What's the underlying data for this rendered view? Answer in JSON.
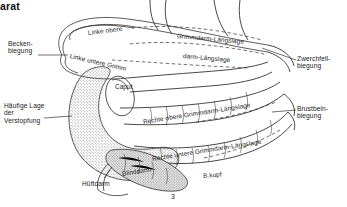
{
  "figure": {
    "title_fragment": "arat",
    "page_number": "3",
    "width": 347,
    "height": 207,
    "background": "#ffffff",
    "ink_color": "#1a1a1a",
    "shading_color": "#a8a8a8"
  },
  "callouts": {
    "left": [
      {
        "id": "becken-biegung",
        "text": "Becken-\nbiegung",
        "x": 8,
        "y": 40
      },
      {
        "id": "haeufige-lage",
        "text": "Häufige Lage\nder\nVerstopfung",
        "x": 4,
        "y": 102
      }
    ],
    "right": [
      {
        "id": "zwerchfell-biegung",
        "text": "Zwerchfell-\nbiegung",
        "x": 297,
        "y": 55
      },
      {
        "id": "brustbein-biegung",
        "text": "Brustbein-\nbiegung",
        "x": 297,
        "y": 105
      }
    ],
    "bottom": [
      {
        "id": "hueftdarm",
        "text": "Hüftdarm",
        "x": 82,
        "y": 180
      }
    ]
  },
  "curve_labels": [
    {
      "id": "linke-obere",
      "text": "Linke obere",
      "x": 88,
      "y": 29,
      "rotate": -7
    },
    {
      "id": "linke-untere-grimm",
      "text": "Linke untere Grimm",
      "x": 70,
      "y": 52,
      "rotate": 13
    },
    {
      "id": "grimmdarm-laengslage-oben",
      "text": "Grimmdarm-Längslage",
      "x": 177,
      "y": 32,
      "rotate": 5
    },
    {
      "id": "grimmdarm-laengslage-unten",
      "text": "darm-Längslage",
      "x": 183,
      "y": 52,
      "rotate": 5
    },
    {
      "id": "rechte-obere",
      "text": "Rechte obere Grimmdarm-Längslage",
      "x": 143,
      "y": 118,
      "rotate": -9
    },
    {
      "id": "rechte-untere",
      "text": "Rechte untere Grimmdarm-Längslage",
      "x": 152,
      "y": 155,
      "rotate": -9
    },
    {
      "id": "blinddarm",
      "text": "Blinddarm",
      "x": 122,
      "y": 170,
      "rotate": -9
    },
    {
      "id": "blinddarm-kopf",
      "text": "B.kopf",
      "x": 203,
      "y": 172,
      "rotate": -5
    },
    {
      "id": "caput",
      "text": "Caput",
      "x": 115,
      "y": 83,
      "rotate": 0
    }
  ]
}
